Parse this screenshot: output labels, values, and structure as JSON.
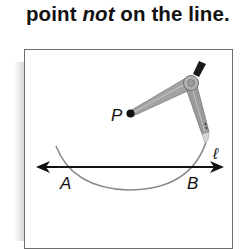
{
  "heading": {
    "prefix": "point ",
    "emphasis": "not",
    "suffix": " on the line."
  },
  "figure": {
    "point_label": "P",
    "line_label": "ℓ",
    "intersection_labels": [
      "A",
      "B"
    ],
    "tool": "compass",
    "colors": {
      "line": "#111111",
      "arc": "#8a8a8a",
      "compass_body": "#9a9a9a",
      "frame": "#6e6e6e"
    }
  }
}
